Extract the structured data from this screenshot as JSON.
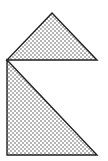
{
  "diagram": {
    "width": 108,
    "height": 161,
    "background": "#ffffff",
    "stroke": "#222222",
    "fill_pattern": "stipple",
    "shapes": [
      {
        "name": "top-triangle",
        "kind": "isosceles-triangle",
        "points": [
          [
            52,
            13
          ],
          [
            97,
            60
          ],
          [
            7,
            60
          ]
        ]
      },
      {
        "name": "bottom-triangle",
        "kind": "right-triangle",
        "points": [
          [
            7,
            60
          ],
          [
            97,
            155
          ],
          [
            7,
            155
          ]
        ]
      }
    ]
  }
}
